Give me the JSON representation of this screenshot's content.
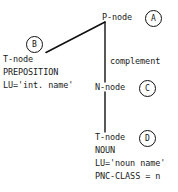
{
  "diagram": {
    "background_color": "#ffffff",
    "line_color": "#111111",
    "text_color": "#1a1a1a",
    "nodes": [
      {
        "id": "p-node",
        "label": "P-node",
        "marker": "A"
      },
      {
        "id": "t-node-prep",
        "label": "T-node",
        "marker": "B"
      },
      {
        "id": "n-node",
        "label": "N-node",
        "marker": "C"
      },
      {
        "id": "t-node-noun",
        "label": "T-node",
        "marker": "D"
      }
    ],
    "edges": [
      {
        "id": "p-to-t",
        "label": ""
      },
      {
        "id": "p-to-n",
        "label": "complement"
      },
      {
        "id": "n-to-t",
        "label": ""
      }
    ],
    "preposition_block": {
      "category": "PREPOSITION",
      "lu": "LU='int. name'"
    },
    "noun_block": {
      "category": "NOUN",
      "lu": "LU='noun name'",
      "pnc_class": "PNC-CLASS = n"
    },
    "markers": {
      "a": "A",
      "b": "B",
      "c": "C",
      "d": "D"
    }
  }
}
